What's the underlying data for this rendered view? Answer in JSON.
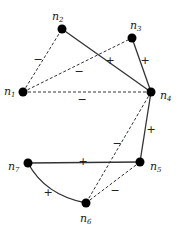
{
  "diagram": {
    "type": "signed-graph",
    "nodes": [
      {
        "id": "n1",
        "base": "n",
        "sub": "1",
        "x": 23,
        "y": 92,
        "lx": 4,
        "ly": 92
      },
      {
        "id": "n2",
        "base": "n",
        "sub": "2",
        "x": 62,
        "y": 29,
        "lx": 52,
        "ly": 17
      },
      {
        "id": "n3",
        "base": "n",
        "sub": "3",
        "x": 132,
        "y": 38,
        "lx": 130,
        "ly": 26
      },
      {
        "id": "n4",
        "base": "n",
        "sub": "4",
        "x": 151,
        "y": 92,
        "lx": 160,
        "ly": 96
      },
      {
        "id": "n5",
        "base": "n",
        "sub": "5",
        "x": 140,
        "y": 162,
        "lx": 150,
        "ly": 167
      },
      {
        "id": "n6",
        "base": "n",
        "sub": "6",
        "x": 86,
        "y": 203,
        "lx": 80,
        "ly": 219
      },
      {
        "id": "n7",
        "base": "n",
        "sub": "7",
        "x": 28,
        "y": 163,
        "lx": 8,
        "ly": 167
      }
    ],
    "edges": [
      {
        "from": "n1",
        "to": "n2",
        "sign": "−",
        "style": "dashed",
        "sx": 38,
        "sy": 60
      },
      {
        "from": "n1",
        "to": "n3",
        "sign": "−",
        "style": "dashed",
        "sx": 79,
        "sy": 72
      },
      {
        "from": "n1",
        "to": "n4",
        "sign": "−",
        "style": "dashed",
        "sx": 82,
        "sy": 100
      },
      {
        "from": "n2",
        "to": "n4",
        "sign": "+",
        "style": "solid",
        "sx": 110,
        "sy": 61
      },
      {
        "from": "n3",
        "to": "n4",
        "sign": "+",
        "style": "solid",
        "sx": 145,
        "sy": 61
      },
      {
        "from": "n4",
        "to": "n5",
        "sign": "+",
        "style": "solid",
        "sx": 151,
        "sy": 130
      },
      {
        "from": "n4",
        "to": "n6",
        "sign": "−",
        "style": "dashed",
        "sx": 117,
        "sy": 144
      },
      {
        "from": "n5",
        "to": "n6",
        "sign": "−",
        "style": "dashed",
        "sx": 115,
        "sy": 191
      },
      {
        "from": "n7",
        "to": "n5",
        "sign": "+",
        "style": "solid",
        "sx": 83,
        "sy": 162
      },
      {
        "from": "n7",
        "to": "n6",
        "sign": "+",
        "style": "solid",
        "curved": true,
        "sx": 48,
        "sy": 193
      }
    ]
  }
}
